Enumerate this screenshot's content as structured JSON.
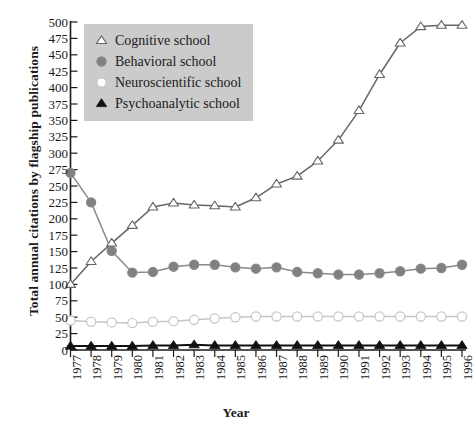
{
  "chart_data": {
    "type": "line",
    "title": "",
    "xlabel": "Year",
    "ylabel": "Total annual citations by flagship publications",
    "xlim": [
      1977,
      1996
    ],
    "ylim": [
      0,
      500
    ],
    "yticks": [
      0,
      25,
      50,
      75,
      100,
      125,
      150,
      175,
      200,
      225,
      250,
      275,
      300,
      325,
      350,
      375,
      400,
      425,
      450,
      475,
      500
    ],
    "grid": false,
    "legend_position": "upper-left",
    "categories": [
      1977,
      1978,
      1979,
      1980,
      1981,
      1982,
      1983,
      1984,
      1985,
      1986,
      1987,
      1988,
      1989,
      1990,
      1991,
      1992,
      1993,
      1994,
      1995,
      1996
    ],
    "series": [
      {
        "name": "Cognitive school",
        "marker": "triangle-open",
        "color": "#666666",
        "marker_fill": "#ffffff",
        "values": [
          100,
          135,
          163,
          190,
          218,
          224,
          221,
          220,
          218,
          232,
          253,
          265,
          288,
          320,
          365,
          420,
          468,
          493,
          495,
          495
        ]
      },
      {
        "name": "Behavioral school",
        "marker": "circle-filled",
        "color": "#8a8a8a",
        "marker_fill": "#808080",
        "values": [
          270,
          225,
          151,
          118,
          119,
          127,
          130,
          130,
          126,
          124,
          126,
          119,
          117,
          115,
          115,
          117,
          120,
          124,
          125,
          130
        ]
      },
      {
        "name": "Neuroscientific school",
        "marker": "circle-open",
        "color": "#c6c6c6",
        "marker_fill": "#ffffff",
        "values": [
          45,
          43,
          42,
          41,
          43,
          44,
          46,
          48,
          50,
          51,
          51,
          51,
          51,
          51,
          51,
          51,
          51,
          51,
          51,
          51
        ]
      },
      {
        "name": "Psychoanalytic school",
        "marker": "triangle-filled",
        "color": "#111111",
        "marker_fill": "#111111",
        "values": [
          6,
          6,
          6,
          6,
          7,
          7,
          8,
          7,
          7,
          7,
          7,
          7,
          7,
          7,
          7,
          7,
          7,
          7,
          7,
          7
        ]
      }
    ]
  },
  "axes": {
    "x_title": "Year",
    "y_title": "Total annual citations by flagship publications"
  },
  "legend": {
    "items": [
      {
        "label": "Cognitive school",
        "marker": "triangle-open-icon"
      },
      {
        "label": "Behavioral school",
        "marker": "circle-filled-gray-icon"
      },
      {
        "label": "Neuroscientific school",
        "marker": "circle-open-icon"
      },
      {
        "label": "Psychoanalytic school",
        "marker": "triangle-filled-icon"
      }
    ]
  },
  "caption": {
    "text": ""
  }
}
